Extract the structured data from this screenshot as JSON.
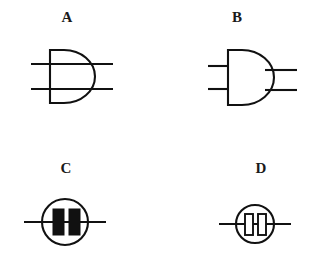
{
  "figure": {
    "background_color": "#ffffff",
    "stroke_color": "#111111",
    "width": 314,
    "height": 268,
    "panels": [
      {
        "id": "a",
        "label": "A",
        "symbol_name": "d-shape-with-two-through-lines",
        "description": "D-shaped (half-round) body with a straight vertical left edge and two horizontal lines passing completely through from left to right",
        "fill": "none",
        "line_count": 2
      },
      {
        "id": "b",
        "label": "B",
        "symbol_name": "d-shape-with-two-stubs-and-two-outputs",
        "description": "D-shaped (half-round) body with two short horizontal stubs on the left side and two horizontal output lines leaving the right side",
        "fill": "none",
        "line_count": 4
      },
      {
        "id": "c",
        "label": "C",
        "symbol_name": "circle-with-two-filled-bars",
        "description": "Circle crossed by a horizontal line, containing two solid black vertical rectangles side by side",
        "fill": "solid",
        "bar_count": 2
      },
      {
        "id": "d",
        "label": "D",
        "symbol_name": "circle-with-two-hollow-bars",
        "description": "Smaller circle crossed by a horizontal line, containing two hollow outlined vertical rectangles side by side",
        "fill": "hollow",
        "bar_count": 2
      }
    ]
  }
}
